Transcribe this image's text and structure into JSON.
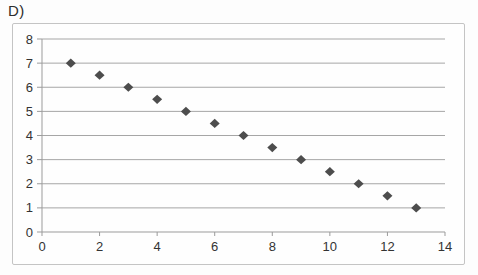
{
  "panel_label": "D)",
  "colors": {
    "background": "#fdfdfd",
    "chart_background": "#fefefe",
    "frame_border": "#c4c4c4",
    "gridline": "#a6a6a6",
    "axis": "#9b9b9b",
    "tick": "#9b9b9b",
    "tick_text": "#333333",
    "marker": "#4d4d4d"
  },
  "chart_data": {
    "type": "scatter",
    "title": "",
    "xlabel": "",
    "ylabel": "",
    "x": [
      1,
      2,
      3,
      4,
      5,
      6,
      7,
      8,
      9,
      10,
      11,
      12,
      13
    ],
    "y": [
      7,
      6.5,
      6,
      5.5,
      5,
      4.5,
      4,
      3.5,
      3,
      2.5,
      2,
      1.5,
      1
    ],
    "xlim": [
      0,
      14
    ],
    "ylim": [
      0,
      8
    ],
    "x_ticks": [
      0,
      2,
      4,
      6,
      8,
      10,
      12,
      14
    ],
    "y_ticks": [
      0,
      1,
      2,
      3,
      4,
      5,
      6,
      7,
      8
    ],
    "grid": "horizontal-only",
    "legend": "none",
    "marker_shape": "diamond",
    "tick_font_size": 13
  }
}
